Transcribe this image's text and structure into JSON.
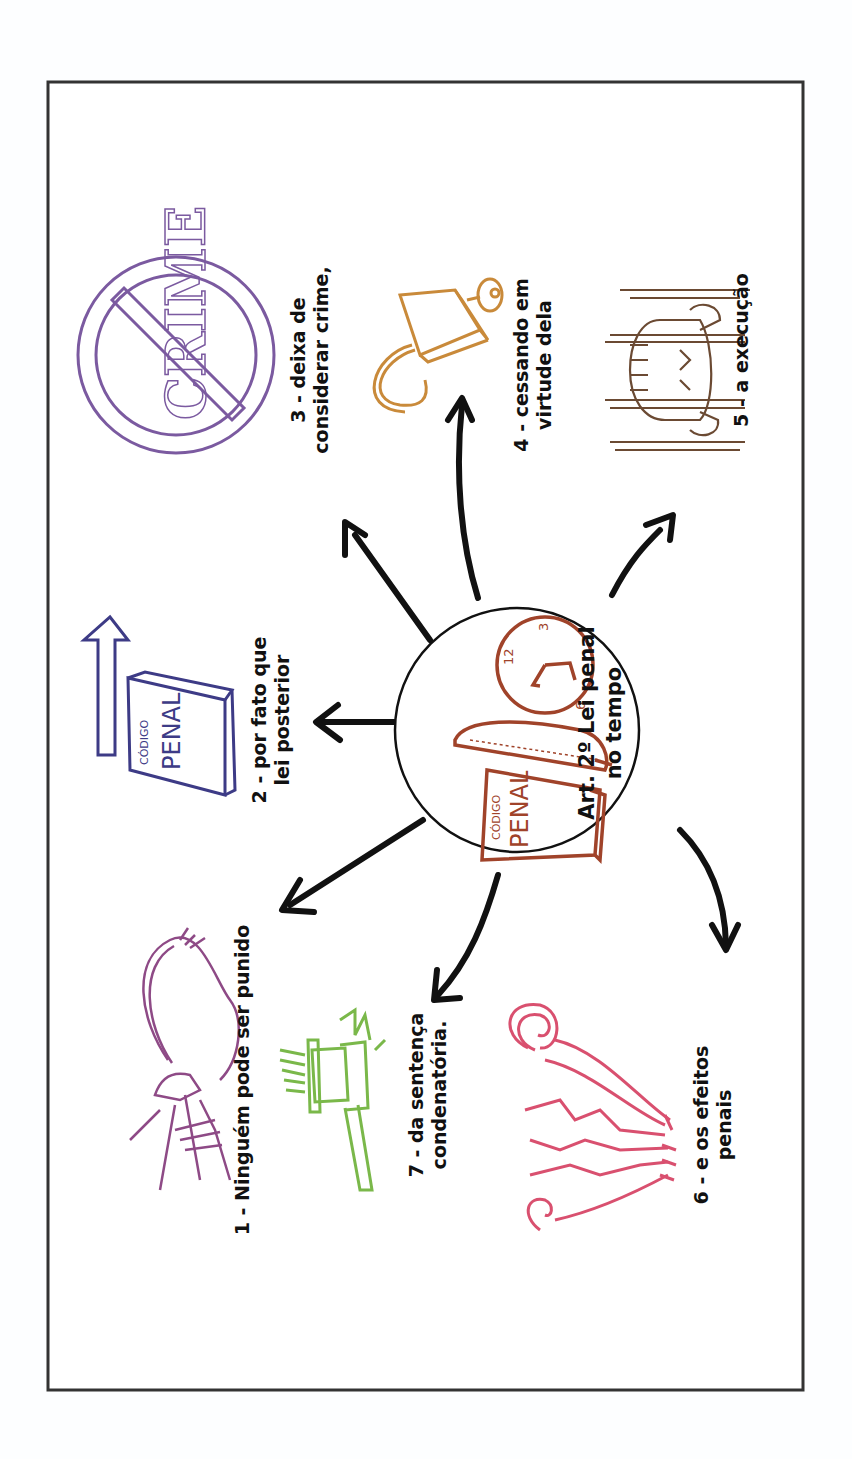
{
  "diagram": {
    "title": "Art. 2º Lei penal no tempo",
    "center": {
      "line1": "Art. 2º Lei penal",
      "line2": "no tempo",
      "book_small": "CÓDIGO",
      "book_big": "PENAL",
      "clock_numbers": [
        "12",
        "3",
        "6"
      ],
      "color": "#a0432a",
      "icons": [
        "book-icon",
        "quill-icon",
        "clock-icon"
      ]
    },
    "nodes": [
      {
        "id": 1,
        "line1": "1 - Ninguém pode ser punido",
        "line2": "",
        "icon": "whip-hand-icon",
        "color": "#8e4a86"
      },
      {
        "id": 2,
        "line1": "2 - por fato que",
        "line2": "lei posterior",
        "icon": "penal-code-book-arrow-icon",
        "color": "#3d3b86",
        "book_small": "CÓDIGO",
        "book_big": "PENAL"
      },
      {
        "id": 3,
        "line1": "3 - deixa de",
        "line2": "considerar crime,",
        "icon": "no-crime-sign-icon",
        "color": "#7b5aa0",
        "sign_text": "CRIME"
      },
      {
        "id": 4,
        "line1": "4 - cessando em",
        "line2": "virtude dela",
        "icon": "open-padlock-icon",
        "color": "#c98a3a"
      },
      {
        "id": 5,
        "line1": "5 - a execução",
        "line2": "",
        "icon": "prisoner-behind-bars-icon",
        "color": "#6b4a33"
      },
      {
        "id": 6,
        "line1": "6 - e os efeitos",
        "line2": "penais",
        "icon": "feathers-icon",
        "color": "#d9506f"
      },
      {
        "id": 7,
        "line1": "7 - da sentença",
        "line2": "condenatória.",
        "icon": "gavel-icon",
        "color": "#7ab84a"
      }
    ]
  }
}
